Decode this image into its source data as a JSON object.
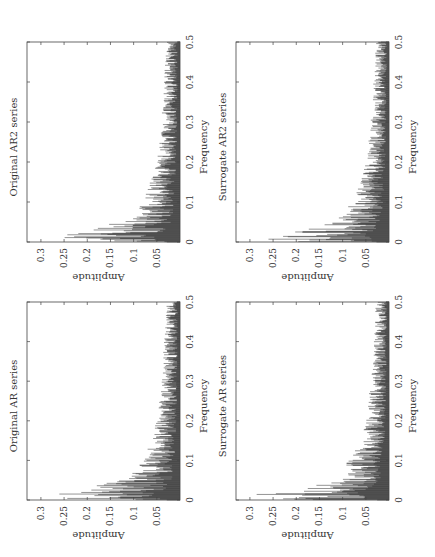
{
  "chart_data": [
    {
      "id": "orig_ar",
      "type": "line",
      "title": "Original AR series",
      "xlabel": "Frequency",
      "ylabel": "Amplitude",
      "xlim": [
        0,
        0.5
      ],
      "ylim": [
        0,
        0.33
      ],
      "xticks": [
        "0",
        "0.1",
        "0.2",
        "0.3",
        "0.4",
        "0.5"
      ],
      "yticks": [
        "0.05",
        "0.1",
        "0.15",
        "0.2",
        "0.25",
        "0.3"
      ],
      "grid": false,
      "rotation_deg": -90,
      "envelope": {
        "x": [
          0,
          0.005,
          0.01,
          0.015,
          0.02,
          0.03,
          0.04,
          0.05,
          0.07,
          0.1,
          0.13,
          0.15,
          0.2,
          0.25,
          0.3,
          0.35,
          0.4,
          0.45,
          0.5
        ],
        "peak": [
          0.19,
          0.31,
          0.25,
          0.32,
          0.29,
          0.2,
          0.18,
          0.12,
          0.1,
          0.08,
          0.07,
          0.065,
          0.05,
          0.045,
          0.04,
          0.038,
          0.035,
          0.032,
          0.03
        ]
      },
      "seed": 11
    },
    {
      "id": "orig_ar2",
      "type": "line",
      "title": "Original AR2 series",
      "xlabel": "Frequency",
      "ylabel": "Amplitude",
      "xlim": [
        0,
        0.5
      ],
      "ylim": [
        0,
        0.33
      ],
      "xticks": [
        "0",
        "0.1",
        "0.2",
        "0.3",
        "0.4",
        "0.5"
      ],
      "yticks": [
        "0.05",
        "0.1",
        "0.15",
        "0.2",
        "0.25",
        "0.3"
      ],
      "grid": false,
      "rotation_deg": -90,
      "envelope": {
        "x": [
          0,
          0.005,
          0.01,
          0.015,
          0.02,
          0.03,
          0.04,
          0.05,
          0.07,
          0.1,
          0.13,
          0.15,
          0.2,
          0.25,
          0.3,
          0.35,
          0.4,
          0.45,
          0.5
        ],
        "peak": [
          0.19,
          0.31,
          0.25,
          0.32,
          0.29,
          0.2,
          0.18,
          0.12,
          0.1,
          0.08,
          0.07,
          0.065,
          0.05,
          0.045,
          0.04,
          0.038,
          0.035,
          0.032,
          0.03
        ]
      },
      "seed": 23
    },
    {
      "id": "surr_ar",
      "type": "line",
      "title": "Surrogate AR series",
      "xlabel": "Frequency",
      "ylabel": "Amplitude",
      "xlim": [
        0,
        0.5
      ],
      "ylim": [
        0,
        0.33
      ],
      "xticks": [
        "0",
        "0.1",
        "0.2",
        "0.3",
        "0.4",
        "0.5"
      ],
      "yticks": [
        "0.05",
        "0.1",
        "0.15",
        "0.2",
        "0.25",
        "0.3"
      ],
      "grid": false,
      "rotation_deg": -90,
      "envelope": {
        "x": [
          0,
          0.005,
          0.01,
          0.015,
          0.02,
          0.03,
          0.04,
          0.05,
          0.07,
          0.1,
          0.13,
          0.15,
          0.2,
          0.25,
          0.3,
          0.35,
          0.4,
          0.45,
          0.5
        ],
        "peak": [
          0.17,
          0.28,
          0.22,
          0.31,
          0.25,
          0.18,
          0.15,
          0.13,
          0.1,
          0.09,
          0.07,
          0.06,
          0.05,
          0.045,
          0.04,
          0.035,
          0.033,
          0.03,
          0.03
        ]
      },
      "seed": 37
    },
    {
      "id": "surr_ar2",
      "type": "line",
      "title": "Surrogate AR2 series",
      "xlabel": "Frequency",
      "ylabel": "Amplitude",
      "xlim": [
        0,
        0.5
      ],
      "ylim": [
        0,
        0.33
      ],
      "xticks": [
        "0",
        "0.1",
        "0.2",
        "0.3",
        "0.4",
        "0.5"
      ],
      "yticks": [
        "0.05",
        "0.1",
        "0.15",
        "0.2",
        "0.25",
        "0.3"
      ],
      "grid": false,
      "rotation_deg": -90,
      "envelope": {
        "x": [
          0,
          0.005,
          0.01,
          0.015,
          0.02,
          0.03,
          0.04,
          0.05,
          0.07,
          0.1,
          0.13,
          0.15,
          0.2,
          0.25,
          0.3,
          0.35,
          0.4,
          0.45,
          0.5
        ],
        "peak": [
          0.18,
          0.29,
          0.23,
          0.29,
          0.24,
          0.2,
          0.16,
          0.13,
          0.1,
          0.085,
          0.07,
          0.065,
          0.05,
          0.045,
          0.04,
          0.036,
          0.034,
          0.03,
          0.03
        ]
      },
      "seed": 53
    }
  ],
  "layout": {
    "panels": [
      {
        "chart": 0,
        "box": [
          27,
          302,
          153,
          198
        ]
      },
      {
        "chart": 1,
        "box": [
          27,
          42,
          153,
          200
        ]
      },
      {
        "chart": 2,
        "box": [
          236,
          302,
          153,
          198
        ]
      },
      {
        "chart": 3,
        "box": [
          236,
          42,
          153,
          200
        ]
      }
    ]
  }
}
